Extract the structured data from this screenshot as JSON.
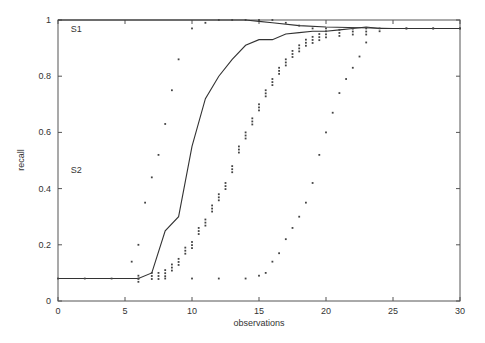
{
  "chart_data": {
    "type": "line",
    "title": "",
    "xlabel": "observations",
    "ylabel": "recall",
    "xlim": [
      0,
      30
    ],
    "ylim": [
      0,
      1
    ],
    "grid": false,
    "legend": null,
    "x_ticks": [
      0,
      5,
      10,
      15,
      20,
      25,
      30
    ],
    "y_ticks": [
      0,
      0.2,
      0.4,
      0.6,
      0.8,
      1
    ],
    "x_tick_labels": [
      "0",
      "5",
      "10",
      "15",
      "20",
      "25",
      "30"
    ],
    "y_tick_labels": [
      "0",
      "0.2",
      "0.4",
      "0.6",
      "0.8",
      "1"
    ],
    "annotations": [
      {
        "text": "S1",
        "x": 0.5,
        "y": 0.97
      },
      {
        "text": "S2",
        "x": 0.5,
        "y": 0.47
      }
    ],
    "series": [
      {
        "name": "S1 mean",
        "style": "solid",
        "x": [
          0,
          5,
          10,
          14,
          15,
          16,
          18,
          20,
          25,
          30
        ],
        "y": [
          1.0,
          1.0,
          1.0,
          1.0,
          0.995,
          0.99,
          0.98,
          0.975,
          0.97,
          0.97
        ]
      },
      {
        "name": "S2 mean",
        "style": "solid",
        "x": [
          0,
          6,
          7,
          8,
          9,
          10,
          11,
          12,
          13,
          14,
          15,
          16,
          17,
          18,
          19,
          20,
          21,
          22,
          23,
          24,
          25,
          30
        ],
        "y": [
          0.08,
          0.08,
          0.1,
          0.25,
          0.3,
          0.55,
          0.72,
          0.8,
          0.86,
          0.91,
          0.93,
          0.93,
          0.95,
          0.955,
          0.96,
          0.96,
          0.965,
          0.97,
          0.975,
          0.97,
          0.97,
          0.97
        ]
      },
      {
        "name": "S1 min",
        "style": "dotted",
        "x": [
          5.5,
          6,
          6.5,
          7,
          7.5,
          8,
          8.5,
          9,
          10,
          11,
          12,
          13,
          14,
          15,
          16,
          17,
          18,
          19,
          20,
          22,
          24,
          26,
          28,
          30
        ],
        "y": [
          0.14,
          0.2,
          0.35,
          0.44,
          0.52,
          0.63,
          0.75,
          0.86,
          0.97,
          0.99,
          1.0,
          1.0,
          1.0,
          1.0,
          1.0,
          0.99,
          0.98,
          0.97,
          0.97,
          0.97,
          0.97,
          0.97,
          0.97,
          0.97
        ]
      },
      {
        "name": "S2 min",
        "style": "dotted",
        "x": [
          0,
          2,
          4,
          6,
          8,
          10,
          12,
          14,
          15,
          15.5,
          16,
          16.5,
          17,
          17.5,
          18,
          18.5,
          19,
          19.5,
          20,
          20.5,
          21,
          21.5,
          22,
          22.5,
          23,
          24,
          26,
          28,
          30
        ],
        "y": [
          0.08,
          0.08,
          0.08,
          0.08,
          0.08,
          0.08,
          0.08,
          0.08,
          0.09,
          0.1,
          0.14,
          0.17,
          0.22,
          0.26,
          0.3,
          0.35,
          0.42,
          0.52,
          0.6,
          0.67,
          0.74,
          0.79,
          0.83,
          0.87,
          0.92,
          0.96,
          0.97,
          0.97,
          0.97
        ]
      },
      {
        "name": "S2 spread (scatter)",
        "style": "scatter",
        "x": [
          6,
          7,
          7.5,
          8,
          8.5,
          9,
          9.5,
          10,
          10.5,
          11,
          11.5,
          12,
          12.5,
          13,
          13.5,
          14,
          14.5,
          15,
          15.5,
          16,
          16.5,
          17,
          17.5,
          18,
          18.5,
          19,
          19.5,
          20,
          21,
          22,
          23
        ],
        "y": [
          0.09,
          0.1,
          0.1,
          0.11,
          0.13,
          0.15,
          0.19,
          0.21,
          0.26,
          0.29,
          0.34,
          0.38,
          0.42,
          0.48,
          0.55,
          0.6,
          0.65,
          0.7,
          0.75,
          0.79,
          0.83,
          0.86,
          0.89,
          0.91,
          0.93,
          0.94,
          0.95,
          0.96,
          0.965,
          0.97,
          0.97
        ]
      }
    ]
  }
}
